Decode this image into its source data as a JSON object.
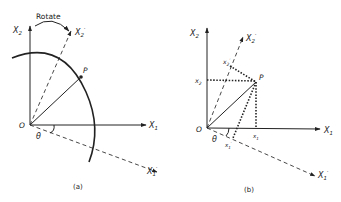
{
  "figure": {
    "panel_a": {
      "caption": "(a)",
      "rotate_label": "Rotate",
      "origin_label": "O",
      "point_label": "P",
      "angle_label": "θ",
      "axes": {
        "x1": "X",
        "x1_sub": "1",
        "x2": "X",
        "x2_sub": "2",
        "x1p": "X",
        "x1p_sub": "1",
        "x2p": "X",
        "x2p_sub": "2",
        "prime": "′"
      }
    },
    "panel_b": {
      "caption": "(b)",
      "origin_label": "O",
      "point_label": "P",
      "angle_label": "θ",
      "axes": {
        "x1": "X",
        "x1_sub": "1",
        "x2": "X",
        "x2_sub": "2",
        "x1p": "X",
        "x1p_sub": "1",
        "x2p": "X",
        "x2p_sub": "2",
        "prime": "′"
      },
      "projections": {
        "x1": "x",
        "x1_sub": "1",
        "x2": "x",
        "x2_sub": "2",
        "x1p": "x",
        "x1p_sub": "1",
        "x2p": "x",
        "x2p_sub": "2",
        "prime": "′"
      }
    }
  }
}
